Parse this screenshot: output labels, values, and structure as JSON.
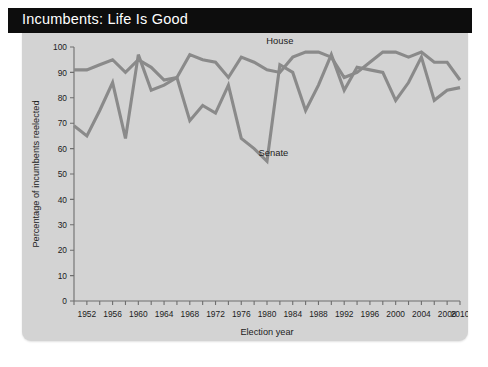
{
  "banner": {
    "title": "Incumbents: Life Is Good"
  },
  "chart_data": {
    "type": "line",
    "title": "Incumbents: Life Is Good",
    "xlabel": "Election year",
    "ylabel": "Percentage of incumbents reelected",
    "xlim": [
      1950,
      2010
    ],
    "ylim": [
      0,
      100
    ],
    "grid": false,
    "legend_position": "inline-annotations",
    "y_ticks": [
      0,
      10,
      20,
      30,
      40,
      50,
      60,
      70,
      80,
      90,
      100
    ],
    "y_tick_labels": [
      "0",
      "10",
      "20",
      "30",
      "40",
      "50",
      "60",
      "70",
      "80",
      "90",
      "100"
    ],
    "x_ticks": [
      1950,
      1952,
      1954,
      1956,
      1958,
      1960,
      1962,
      1964,
      1966,
      1968,
      1970,
      1972,
      1974,
      1976,
      1978,
      1980,
      1982,
      1984,
      1986,
      1988,
      1990,
      1992,
      1994,
      1996,
      1998,
      2000,
      2002,
      2004,
      2006,
      2008,
      2010
    ],
    "x_tick_labels": [
      "1952",
      "1956",
      "1960",
      "1964",
      "1968",
      "1972",
      "1976",
      "1980",
      "1984",
      "1988",
      "1992",
      "1996",
      "2000",
      "2004",
      "2008",
      "2010"
    ],
    "x_tick_label_years": [
      1952,
      1956,
      1960,
      1964,
      1968,
      1972,
      1976,
      1980,
      1984,
      1988,
      1992,
      1996,
      2000,
      2004,
      2008,
      2010
    ],
    "x": [
      1950,
      1952,
      1954,
      1956,
      1958,
      1960,
      1962,
      1964,
      1966,
      1968,
      1970,
      1972,
      1974,
      1976,
      1978,
      1980,
      1982,
      1984,
      1986,
      1988,
      1990,
      1992,
      1994,
      1996,
      1998,
      2000,
      2002,
      2004,
      2006,
      2008,
      2010
    ],
    "series": [
      {
        "name": "House",
        "color": "#8a8a8a",
        "label_year": 1982,
        "label_value": 101,
        "values": [
          91,
          91,
          93,
          95,
          90,
          95,
          92,
          87,
          88,
          97,
          95,
          94,
          88,
          96,
          94,
          91,
          90,
          96,
          98,
          98,
          96,
          88,
          90,
          94,
          98,
          98,
          96,
          98,
          94,
          94,
          87
        ]
      },
      {
        "name": "Senate",
        "color": "#8a8a8a",
        "label_year": 1981,
        "label_value": 57,
        "values": [
          69,
          65,
          75,
          86,
          64,
          97,
          83,
          85,
          88,
          71,
          77,
          74,
          85,
          64,
          60,
          55,
          93,
          90,
          75,
          85,
          97,
          83,
          92,
          91,
          90,
          79,
          86,
          96,
          79,
          83,
          84
        ]
      }
    ],
    "annotations": [
      {
        "text": "House",
        "x": 1982,
        "y": 101
      },
      {
        "text": "Senate",
        "x": 1981,
        "y": 57
      }
    ]
  }
}
